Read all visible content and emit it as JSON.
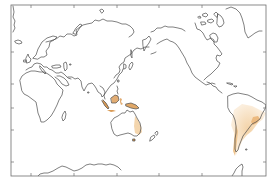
{
  "map": {
    "projection": "equirectangular, Pacific-centered",
    "colors": {
      "background": "#ffffff",
      "coastline": "#4a4a4a",
      "frame": "#6e6e6e",
      "shading_light": "#f6dcb8",
      "shading_mid": "#eebf86",
      "shading_dark": "#d99a55"
    },
    "x_ticks_count": 5,
    "y_ticks_count": 5,
    "shaded_regions": [
      {
        "name": "maritime-southeast-asia",
        "intensity": 0.7
      },
      {
        "name": "new-guinea",
        "intensity": 0.6
      },
      {
        "name": "eastern-australia",
        "intensity": 0.5
      },
      {
        "name": "south-america-amazon",
        "intensity": 0.35
      },
      {
        "name": "south-america-southeast-brazil",
        "intensity": 0.6
      },
      {
        "name": "andes-west-coast",
        "intensity": 0.5
      }
    ]
  }
}
